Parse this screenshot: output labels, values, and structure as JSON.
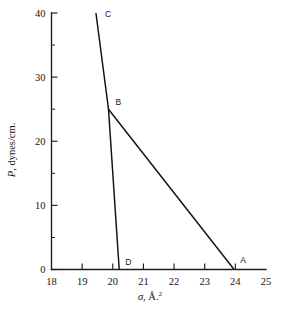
{
  "chart_data": {
    "type": "line",
    "title": "",
    "subtitle": "",
    "xlabel": "σ, Å.²",
    "ylabel": "P, dynes/cm.",
    "xlim": [
      18,
      25
    ],
    "ylim": [
      0,
      40
    ],
    "grid": false,
    "legend": "none",
    "x_ticks": [
      18,
      19,
      20,
      21,
      22,
      23,
      24,
      25
    ],
    "x_tick_labels": [
      "18",
      "19",
      "20",
      "21",
      "22",
      "23",
      "24",
      "25"
    ],
    "y_ticks": [
      0,
      10,
      20,
      30,
      40
    ],
    "y_tick_labels": [
      "0",
      "10",
      "20",
      "30",
      "40"
    ],
    "y_minor_ticks": [
      5,
      15,
      25,
      35
    ],
    "series": [
      {
        "name": "C-B-D",
        "points": [
          {
            "x": 19.45,
            "y": 40.0
          },
          {
            "x": 19.86,
            "y": 25.0
          },
          {
            "x": 20.21,
            "y": 0.0
          }
        ]
      },
      {
        "name": "B-A",
        "points": [
          {
            "x": 19.86,
            "y": 25.0
          },
          {
            "x": 23.96,
            "y": 0.0
          }
        ]
      }
    ],
    "annotations": [
      {
        "label": "C",
        "x": 19.45,
        "y": 40.0,
        "dx": 9,
        "dy": 4
      },
      {
        "label": "B",
        "x": 19.86,
        "y": 25.0,
        "dx": 7,
        "dy": -4
      },
      {
        "label": "D",
        "x": 20.21,
        "y": 0.0,
        "dx": 6,
        "dy": -5
      },
      {
        "label": "A",
        "x": 23.96,
        "y": 0.0,
        "dx": 6,
        "dy": -7
      }
    ]
  },
  "axes": {
    "y_title_parts": {
      "symbol": "P",
      "rest": ", dynes/cm."
    },
    "x_title_parts": {
      "symbol": "σ",
      "rest": ", Å.",
      "exponent": "2"
    }
  },
  "colors": {
    "ink": "#111111",
    "axis": "#1d1d1d",
    "background": "#ffffff"
  }
}
